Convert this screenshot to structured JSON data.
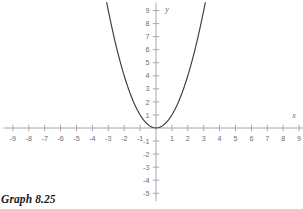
{
  "figure": {
    "caption": "Graph 8.25",
    "axis_color": "#a8a8a8",
    "curve_color": "#3d3d3d",
    "label_color": "#6d6d6d",
    "background": "#ffffff"
  },
  "chart_data": {
    "type": "line",
    "title": "",
    "subtitle": "",
    "xlabel": "x",
    "ylabel": "y",
    "xlim": [
      -9.6,
      9.6
    ],
    "ylim": [
      -5.6,
      9.6
    ],
    "grid": false,
    "legend": null,
    "x_ticks": [
      -9,
      -8,
      -7,
      -6,
      -5,
      -4,
      -3,
      -2,
      -1,
      1,
      2,
      3,
      4,
      5,
      6,
      7,
      8,
      9
    ],
    "x_tick_labels": [
      "-9",
      "-8",
      "-7",
      "-6",
      "-5",
      "-4",
      "-3",
      "-2",
      "-1",
      "1",
      "2",
      "3",
      "4",
      "5",
      "6",
      "7",
      "8",
      "9"
    ],
    "y_ticks": [
      9,
      8,
      7,
      6,
      5,
      4,
      3,
      2,
      1,
      -1,
      -2,
      -3,
      -4,
      -5
    ],
    "y_tick_labels": [
      "9",
      "8",
      "7",
      "6",
      "5",
      "4",
      "3",
      "2",
      "1",
      "-1",
      "-2",
      "-3",
      "-4",
      "-5"
    ],
    "series": [
      {
        "name": "y = x^2",
        "equation": "y = x^2",
        "x": [
          -3.1,
          -3.0,
          -2.8,
          -2.6,
          -2.4,
          -2.2,
          -2.0,
          -1.8,
          -1.6,
          -1.4,
          -1.2,
          -1.0,
          -0.8,
          -0.6,
          -0.4,
          -0.2,
          0.0,
          0.2,
          0.4,
          0.6,
          0.8,
          1.0,
          1.2,
          1.4,
          1.6,
          1.8,
          2.0,
          2.2,
          2.4,
          2.6,
          2.8,
          3.0,
          3.1
        ],
        "values": [
          9.61,
          9.0,
          7.84,
          6.76,
          5.76,
          4.84,
          4.0,
          3.24,
          2.56,
          1.96,
          1.44,
          1.0,
          0.64,
          0.36,
          0.16,
          0.04,
          0.0,
          0.04,
          0.16,
          0.36,
          0.64,
          1.0,
          1.44,
          1.96,
          2.56,
          3.24,
          4.0,
          4.84,
          5.76,
          6.76,
          7.84,
          9.0,
          9.61
        ]
      }
    ],
    "vertex": [
      0,
      0
    ]
  }
}
